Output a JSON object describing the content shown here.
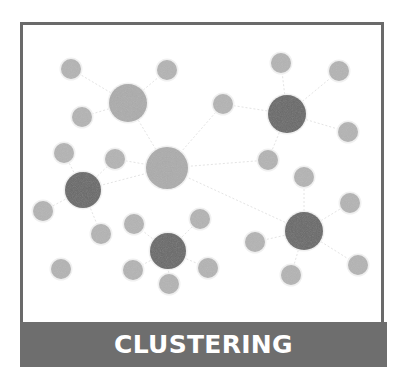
{
  "title": "CLUSTERING",
  "colors": {
    "frame": "#6a6a6a",
    "banner": "#6e6e6e",
    "banner_text": "#ffffff",
    "light_node": "#b4b4b4",
    "medium_node": "#acacac",
    "dark_node": "#686868",
    "edge": "#e4e4e4"
  },
  "nodes": [
    {
      "x": 71,
      "y": 69,
      "r": 10,
      "kind": "light"
    },
    {
      "x": 167,
      "y": 70,
      "r": 10,
      "kind": "light"
    },
    {
      "x": 281,
      "y": 63,
      "r": 10,
      "kind": "light"
    },
    {
      "x": 339,
      "y": 71,
      "r": 10,
      "kind": "light"
    },
    {
      "x": 128,
      "y": 103,
      "r": 19,
      "kind": "medium"
    },
    {
      "x": 82,
      "y": 117,
      "r": 10,
      "kind": "light"
    },
    {
      "x": 223,
      "y": 104,
      "r": 10,
      "kind": "light"
    },
    {
      "x": 287,
      "y": 114,
      "r": 19,
      "kind": "dark"
    },
    {
      "x": 348,
      "y": 132,
      "r": 10,
      "kind": "light"
    },
    {
      "x": 64,
      "y": 153,
      "r": 10,
      "kind": "light"
    },
    {
      "x": 115,
      "y": 159,
      "r": 10,
      "kind": "light"
    },
    {
      "x": 167,
      "y": 168,
      "r": 21,
      "kind": "medium"
    },
    {
      "x": 268,
      "y": 160,
      "r": 10,
      "kind": "light"
    },
    {
      "x": 304,
      "y": 177,
      "r": 10,
      "kind": "light"
    },
    {
      "x": 83,
      "y": 190,
      "r": 18,
      "kind": "dark"
    },
    {
      "x": 43,
      "y": 211,
      "r": 10,
      "kind": "light"
    },
    {
      "x": 350,
      "y": 203,
      "r": 10,
      "kind": "light"
    },
    {
      "x": 134,
      "y": 224,
      "r": 10,
      "kind": "light"
    },
    {
      "x": 200,
      "y": 219,
      "r": 10,
      "kind": "light"
    },
    {
      "x": 101,
      "y": 234,
      "r": 10,
      "kind": "light"
    },
    {
      "x": 304,
      "y": 231,
      "r": 19,
      "kind": "dark"
    },
    {
      "x": 255,
      "y": 242,
      "r": 10,
      "kind": "light"
    },
    {
      "x": 168,
      "y": 251,
      "r": 18,
      "kind": "dark"
    },
    {
      "x": 61,
      "y": 269,
      "r": 10,
      "kind": "light"
    },
    {
      "x": 133,
      "y": 270,
      "r": 10,
      "kind": "light"
    },
    {
      "x": 208,
      "y": 268,
      "r": 10,
      "kind": "light"
    },
    {
      "x": 169,
      "y": 284,
      "r": 10,
      "kind": "light"
    },
    {
      "x": 291,
      "y": 275,
      "r": 10,
      "kind": "light"
    },
    {
      "x": 358,
      "y": 265,
      "r": 10,
      "kind": "light"
    }
  ],
  "edges": [
    [
      4,
      0
    ],
    [
      4,
      1
    ],
    [
      4,
      5
    ],
    [
      4,
      11
    ],
    [
      7,
      2
    ],
    [
      7,
      3
    ],
    [
      7,
      6
    ],
    [
      7,
      8
    ],
    [
      7,
      12
    ],
    [
      11,
      10
    ],
    [
      11,
      6
    ],
    [
      11,
      14
    ],
    [
      11,
      20
    ],
    [
      11,
      12
    ],
    [
      14,
      9
    ],
    [
      14,
      15
    ],
    [
      14,
      19
    ],
    [
      14,
      10
    ],
    [
      22,
      17
    ],
    [
      22,
      18
    ],
    [
      22,
      24
    ],
    [
      22,
      25
    ],
    [
      22,
      26
    ],
    [
      20,
      13
    ],
    [
      20,
      16
    ],
    [
      20,
      21
    ],
    [
      20,
      27
    ],
    [
      20,
      28
    ]
  ]
}
